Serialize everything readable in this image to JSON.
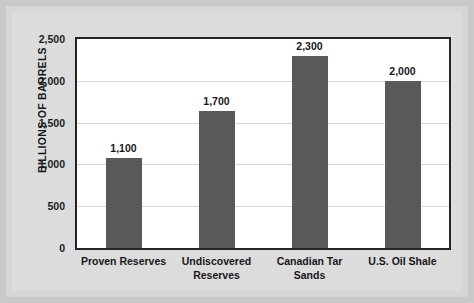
{
  "chart_data": {
    "type": "bar",
    "title": "",
    "subtitle": "",
    "xlabel": "",
    "ylabel": "BILLIONS OF BARRELS",
    "categories": [
      "Proven Reserves",
      "Undiscovered Reserves",
      "Canadian Tar Sands",
      "U.S. Oil Shale"
    ],
    "category_lines": [
      [
        "Proven Reserves"
      ],
      [
        "Undiscovered",
        "Reserves"
      ],
      [
        "Canadian Tar",
        "Sands"
      ],
      [
        "U.S. Oil Shale"
      ]
    ],
    "values": [
      1100,
      1700,
      2300,
      2000
    ],
    "value_labels": [
      "1,100",
      "1,700",
      "2,300",
      "2,000"
    ],
    "plotted_values": [
      1080,
      1640,
      2300,
      2000
    ],
    "ylim": [
      0,
      2500
    ],
    "yticks": [
      0,
      500,
      1000,
      1500,
      2000,
      2500
    ],
    "ytick_labels": [
      "0",
      "500",
      "1,000",
      "1,500",
      "2,000",
      "2,500"
    ],
    "grid": true,
    "grid_axis": "y",
    "legend": false,
    "legend_position": "none",
    "series": [
      {
        "name": "Billions of barrels",
        "values": [
          1100,
          1700,
          2300,
          2000
        ]
      }
    ],
    "colors": {
      "bar_fill": "#595959",
      "plot_background": "#ffffff",
      "plot_border": "#242424",
      "gridline": "#d8d8d8",
      "panel_background": "#dcdcdc",
      "page_background": "#d6d6d6",
      "outer_background": "#c9c9c9",
      "text": "#17171a"
    }
  }
}
